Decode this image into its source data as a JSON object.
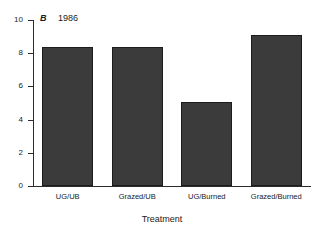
{
  "chart_data": {
    "type": "bar",
    "title": "",
    "panel_label": "B",
    "year_label": "1986",
    "categories": [
      "UG/UB",
      "Grazed/UB",
      "UG/Burned",
      "Grazed/Burned"
    ],
    "values": [
      8.35,
      8.35,
      5.05,
      9.1
    ],
    "xlabel": "Treatment",
    "ylabel": "",
    "ylim": [
      0,
      10
    ],
    "yticks": [
      0,
      2,
      4,
      6,
      8,
      10
    ],
    "ytick_labels": [
      "0",
      "2",
      "4",
      "6",
      "8",
      "10"
    ],
    "grid": false,
    "legend": null,
    "bar_color": "#3b3b3b",
    "bar_edge_color": "#1c1c1c",
    "axis_color": "#2b2b2b",
    "background_color": "#ffffff"
  }
}
